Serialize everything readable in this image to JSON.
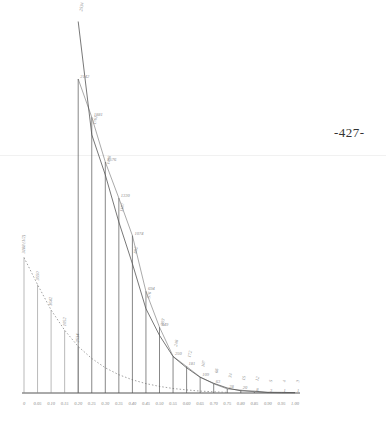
{
  "page_number": "-427-",
  "colors": {
    "ink": "#555555",
    "faint_ink": "#8a8a8a",
    "background": "#ffffff"
  },
  "chart_data": {
    "type": "line",
    "title": "",
    "xlabel": "",
    "ylabel": "",
    "grid": false,
    "legend": null,
    "x_ticks": [
      "0",
      "0.05",
      "0.10",
      "0.15",
      "0.20",
      "0.25",
      "0.30",
      "0.35",
      "0.40",
      "0.45",
      "0.50",
      "0.55",
      "0.60",
      "0.65",
      "0.70",
      "0.75",
      "0.80",
      "0.85",
      "0.90",
      "0.95",
      "1.00"
    ],
    "xlim": [
      0,
      1.0
    ],
    "ylim": [
      0,
      2600
    ],
    "series": [
      {
        "name": "dotted-decay-curve",
        "style": "dotted",
        "x": [
          0,
          0.05,
          0.1,
          0.15,
          0.2,
          0.25,
          0.3,
          0.35,
          0.4,
          0.45,
          0.5,
          0.55,
          0.6,
          0.65,
          0.7,
          0.75
        ],
        "values": [
          924,
          740,
          566,
          428,
          317,
          235,
          172,
          125,
          90,
          64,
          45,
          31,
          21,
          13,
          8,
          4
        ],
        "bar_labels": [
          "3188 (1/2)",
          "3550",
          "1642",
          "1052",
          "2534"
        ]
      },
      {
        "name": "upper-curve",
        "style": "solid",
        "x": [
          0.2,
          0.25,
          0.3,
          0.35,
          0.4,
          0.45,
          0.5,
          0.55,
          0.6,
          0.65,
          0.7,
          0.75,
          0.8,
          0.85,
          0.9,
          0.95,
          1.0
        ],
        "values": [
          2534,
          1761,
          1488,
          1167,
          882,
          576,
          393,
          248,
          172,
          107,
          66,
          34,
          15,
          12,
          5,
          4,
          3
        ],
        "labels": [
          "2534",
          "1761",
          "1488",
          "1167",
          "882",
          "576",
          "393",
          "248",
          "172",
          "107",
          "66",
          "34",
          "15",
          "12",
          "5",
          "4",
          "3"
        ]
      },
      {
        "name": "lower-curve",
        "style": "solid-thin",
        "x": [
          0.2,
          0.25,
          0.3,
          0.35,
          0.4,
          0.45,
          0.5,
          0.55,
          0.6,
          0.65,
          0.7,
          0.75,
          0.8,
          0.85,
          0.9,
          0.95,
          1.0
        ],
        "values": [
          2142,
          1881,
          1576,
          1330,
          1074,
          694,
          449,
          250,
          181,
          109,
          63,
          28,
          20,
          8,
          3,
          1,
          1
        ],
        "labels": [
          "2142",
          "1881",
          "1576",
          "1330",
          "1074",
          "694",
          "449",
          "250",
          "181",
          "109",
          "63",
          "28",
          "20",
          "8",
          "3",
          "1",
          "1"
        ]
      }
    ]
  }
}
